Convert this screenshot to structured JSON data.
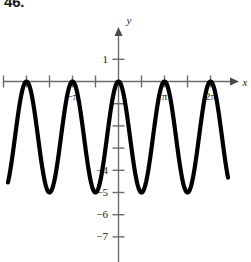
{
  "problem": {
    "number": "46."
  },
  "chart_data": {
    "type": "line",
    "title": "",
    "xlabel": "x",
    "ylabel": "y",
    "function": "y = -2.5 + 2.5*cos(2x)",
    "xlim": [
      -3.55,
      7.35
    ],
    "ylim": [
      -7.4,
      1.6
    ],
    "grid": false,
    "legend": null,
    "amplitude": 2.5,
    "midline": -2.5,
    "period": 3.141592653589793,
    "maxima": [
      {
        "x": -3.141592653589793,
        "y": 0
      },
      {
        "x": 0,
        "y": 0
      },
      {
        "x": 6.283185307179586,
        "y": 0
      }
    ],
    "minima": [
      {
        "x": -1.5707963267948966,
        "y": -5
      },
      {
        "x": 3.141592653589793,
        "y": -5
      }
    ],
    "x_axis": {
      "arrow": true,
      "label": "x",
      "tick_interval_value": 1.5707963267948966,
      "tick_interval_label": "pi/2",
      "tick_values": [
        -4.71238898038469,
        -3.926990816987241,
        -3.141592653589793,
        -2.356194490192345,
        -1.570796326794897,
        -0.785398163397448,
        0,
        0.785398163397448,
        1.570796326794897,
        2.356194490192345,
        3.141592653589793,
        3.926990816987241,
        4.71238898038469,
        5.497787143782138,
        6.283185307179586
      ],
      "labeled_ticks": [
        {
          "value": -3.141592653589793,
          "label": "−π"
        },
        {
          "value": 3.141592653589793,
          "label": "π"
        },
        {
          "value": 6.283185307179586,
          "label": "2π"
        }
      ]
    },
    "y_axis": {
      "arrow": true,
      "label": "y",
      "tick_interval_value": 1,
      "tick_values": [
        1,
        -1,
        -2,
        -3,
        -4,
        -5,
        -6,
        -7
      ],
      "labeled_ticks": [
        {
          "value": 1,
          "label": "1"
        },
        {
          "value": -4,
          "label": "−4"
        },
        {
          "value": -5,
          "label": "−5"
        },
        {
          "value": -6,
          "label": "−6"
        },
        {
          "value": -7,
          "label": "−7"
        }
      ]
    },
    "colors": {
      "curve": "#000000",
      "axis": "#6b6b6b",
      "text": "#231f20",
      "background": "#ffffff"
    }
  }
}
